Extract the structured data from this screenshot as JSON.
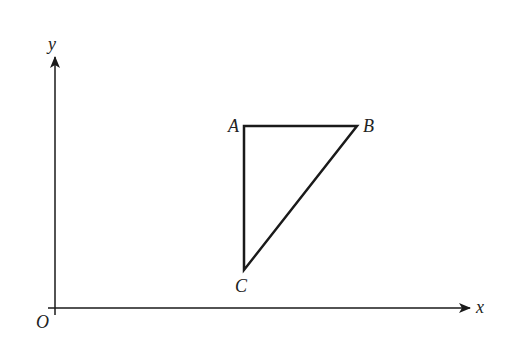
{
  "diagram": {
    "type": "coordinate-geometry",
    "axes": {
      "origin_label": "O",
      "x_label": "x",
      "y_label": "y",
      "origin_px": [
        55,
        308
      ],
      "x_axis_end_px": [
        470,
        308
      ],
      "y_axis_end_px": [
        55,
        57
      ]
    },
    "triangle": {
      "vertices": [
        {
          "label": "A",
          "px": [
            244,
            126
          ]
        },
        {
          "label": "B",
          "px": [
            357,
            126
          ]
        },
        {
          "label": "C",
          "px": [
            244,
            270
          ]
        }
      ],
      "right_angle_at": "A"
    },
    "colors": {
      "stroke": "#1a1a1a",
      "background": "#ffffff"
    }
  }
}
